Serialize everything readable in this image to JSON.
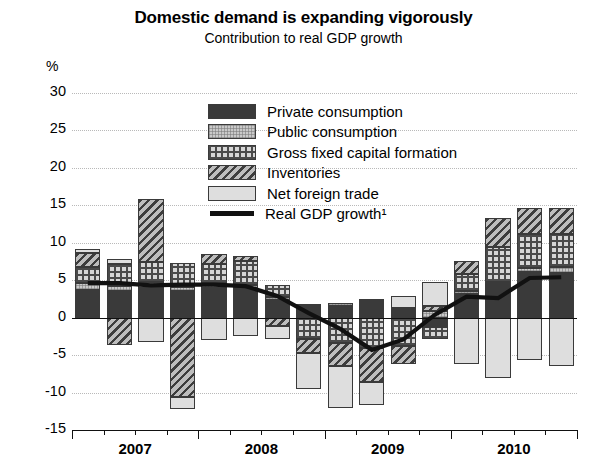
{
  "header": {
    "title": "Domestic demand is expanding vigorously",
    "subtitle": "Contribution to real GDP growth",
    "unit": "%"
  },
  "legend": {
    "items": [
      {
        "label": "Private consumption",
        "pattern": "solid-dark",
        "color": "#3a3a3a"
      },
      {
        "label": "Public consumption",
        "pattern": "fine-dotted",
        "color": "#c9c9c9"
      },
      {
        "label": "Gross fixed capital formation",
        "pattern": "cross-hatch-grid",
        "color": "#d6d6d6"
      },
      {
        "label": "Inventories",
        "pattern": "diagonal-hatch",
        "color": "#bdbdbd"
      },
      {
        "label": "Net foreign trade",
        "pattern": "light-plain",
        "color": "#dedede"
      },
      {
        "label": "Real GDP growth¹",
        "pattern": "line",
        "color": "#111111"
      }
    ]
  },
  "chart_data": {
    "type": "bar",
    "stacked": true,
    "title": "Domestic demand is expanding vigorously",
    "subtitle": "Contribution to real GDP growth",
    "xlabel": "",
    "ylabel": "%",
    "ylim": [
      -15,
      30
    ],
    "yticks": [
      30,
      25,
      20,
      15,
      10,
      5,
      0,
      -5,
      -10,
      -15
    ],
    "grid": true,
    "legend_position": "inside-top-center",
    "year_labels": [
      "2007",
      "2008",
      "2009",
      "2010"
    ],
    "categories": [
      "2007Q1",
      "2007Q2",
      "2007Q3",
      "2007Q4",
      "2008Q1",
      "2008Q2",
      "2008Q3",
      "2008Q4",
      "2009Q1",
      "2009Q2",
      "2009Q3",
      "2009Q4",
      "2010Q1",
      "2010Q2",
      "2010Q3",
      "2010Q4"
    ],
    "series": [
      {
        "name": "Private consumption",
        "values": [
          3.7,
          3.6,
          4.0,
          3.6,
          4.0,
          3.9,
          2.4,
          1.5,
          1.5,
          2.2,
          1.0,
          -1.2,
          3.1,
          4.5,
          6.1,
          6.0
        ]
      },
      {
        "name": "Public consumption",
        "values": [
          0.9,
          0.6,
          0.7,
          0.5,
          0.6,
          0.5,
          0.4,
          0.3,
          0.4,
          0.3,
          0.3,
          0.9,
          0.5,
          0.3,
          0.5,
          0.8
        ]
      },
      {
        "name": "Gross fixed capital formation",
        "values": [
          2.2,
          3.0,
          2.7,
          3.2,
          2.5,
          3.2,
          1.5,
          -2.8,
          -3.4,
          -4.1,
          -3.8,
          -1.7,
          2.2,
          4.7,
          4.6,
          4.4
        ]
      },
      {
        "name": "Inventories",
        "values": [
          1.8,
          -3.6,
          8.5,
          -10.6,
          1.4,
          0.6,
          -1.1,
          -1.9,
          -3.1,
          -4.5,
          -2.4,
          0.7,
          1.8,
          3.8,
          3.5,
          3.4
        ]
      },
      {
        "name": "Net foreign trade",
        "values": [
          0.6,
          0.7,
          -3.2,
          -1.6,
          -3.0,
          -2.4,
          -1.7,
          -4.8,
          -5.6,
          -3.0,
          1.6,
          3.1,
          -6.2,
          -8.1,
          -5.7,
          -6.5
        ]
      }
    ],
    "line_series": {
      "name": "Real GDP growth¹",
      "values": [
        4.6,
        4.6,
        4.3,
        4.4,
        4.4,
        4.2,
        2.9,
        0.6,
        -1.5,
        -4.3,
        -2.9,
        0.4,
        2.8,
        2.6,
        5.3,
        5.4
      ]
    }
  },
  "axis": {
    "y_ticks": [
      "30",
      "25",
      "20",
      "15",
      "10",
      "5",
      "0",
      "-5",
      "-10",
      "-15"
    ]
  }
}
